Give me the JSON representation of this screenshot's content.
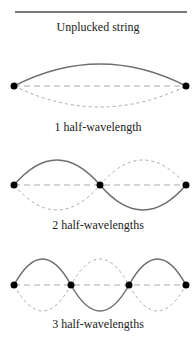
{
  "colors": {
    "solid": "#6e6e6e",
    "dashed": "#aaaaaa",
    "node": "#000000",
    "text": "#222222"
  },
  "panels": [
    {
      "label": "Unplucked string",
      "half_wavelengths": 0
    },
    {
      "label": "1 half-wavelength",
      "half_wavelengths": 1
    },
    {
      "label": "2 half-wavelengths",
      "half_wavelengths": 2
    },
    {
      "label": "3 half-wavelengths",
      "half_wavelengths": 3
    }
  ]
}
